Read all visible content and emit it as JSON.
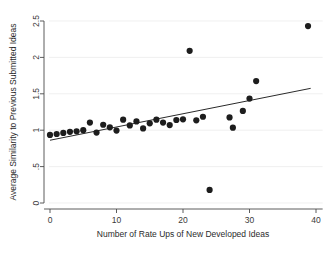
{
  "chart_data": {
    "type": "scatter",
    "title": "",
    "xlabel": "Number of Rate Ups of New Developed Ideas",
    "ylabel": "Average Similarity to Previous Submitted Ideas",
    "xlim": [
      -1.5,
      41
    ],
    "ylim": [
      -0.08,
      2.58
    ],
    "xticks": [
      0,
      10,
      20,
      30,
      40
    ],
    "xtick_labels": [
      "0",
      "10",
      "20",
      "30",
      "40"
    ],
    "yticks": [
      0,
      0.5,
      1,
      1.5,
      2,
      2.5
    ],
    "ytick_labels": [
      "0",
      ".5",
      "1",
      "1.5",
      "2",
      "2.5"
    ],
    "grid": "horizontal-faint",
    "legend": "none",
    "marker": "filled-circle",
    "marker_color": "#1d1d1d",
    "marker_size_px": 3.1,
    "points": [
      {
        "x": 0,
        "y": 0.935
      },
      {
        "x": 1,
        "y": 0.948
      },
      {
        "x": 2,
        "y": 0.963
      },
      {
        "x": 3,
        "y": 0.978
      },
      {
        "x": 4,
        "y": 0.985
      },
      {
        "x": 5,
        "y": 1.0
      },
      {
        "x": 6,
        "y": 1.105
      },
      {
        "x": 7,
        "y": 0.968
      },
      {
        "x": 8,
        "y": 1.075
      },
      {
        "x": 9,
        "y": 1.04
      },
      {
        "x": 10,
        "y": 0.995
      },
      {
        "x": 11,
        "y": 1.145
      },
      {
        "x": 12,
        "y": 1.065
      },
      {
        "x": 13,
        "y": 1.12
      },
      {
        "x": 14,
        "y": 1.025
      },
      {
        "x": 15,
        "y": 1.095
      },
      {
        "x": 16,
        "y": 1.145
      },
      {
        "x": 17,
        "y": 1.105
      },
      {
        "x": 18,
        "y": 1.07
      },
      {
        "x": 19,
        "y": 1.14
      },
      {
        "x": 20,
        "y": 1.15
      },
      {
        "x": 21,
        "y": 2.09
      },
      {
        "x": 22,
        "y": 1.135
      },
      {
        "x": 23,
        "y": 1.185
      },
      {
        "x": 24,
        "y": 0.18
      },
      {
        "x": 27,
        "y": 1.175
      },
      {
        "x": 27.5,
        "y": 1.035
      },
      {
        "x": 29,
        "y": 1.265
      },
      {
        "x": 30,
        "y": 1.435
      },
      {
        "x": 31,
        "y": 1.675
      },
      {
        "x": 38.8,
        "y": 2.43
      }
    ],
    "fit_line": {
      "type": "linear",
      "x_start": 0,
      "y_start": 0.862,
      "x_end": 39.2,
      "y_end": 1.575,
      "slope": 0.0182,
      "intercept": 0.862,
      "color": "#2a2a2a"
    }
  }
}
